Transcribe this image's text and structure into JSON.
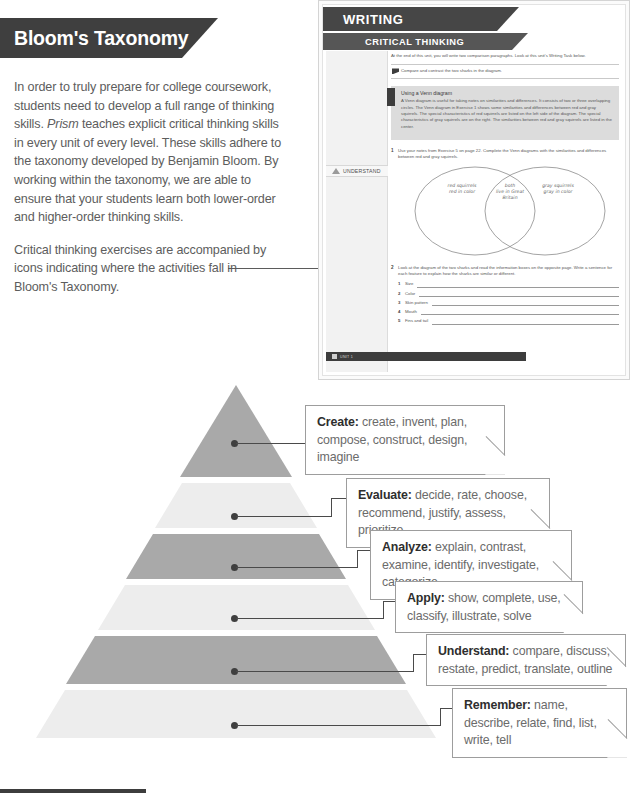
{
  "header": {
    "title": "Bloom's Taxonomy"
  },
  "intro": {
    "paragraph1_a": "In order to truly prepare for college coursework, students need to develop a full range of thinking skills. ",
    "paragraph1_em": "Prism",
    "paragraph1_b": " teaches explicit critical thinking skills in every unit of every level. These skills adhere to the taxonomy developed by Benjamin Bloom. By working within the taxonomy, we are able to ensure that your students learn both lower-order and higher-order thinking skills.",
    "paragraph2": "Critical thinking exercises are accompanied by icons indicating where the activities fall in Bloom's Taxonomy."
  },
  "page_mockup": {
    "banner_writing": "WRITING",
    "banner_critical_thinking": "CRITICAL THINKING",
    "intro_text": "At the end of this unit, you will write two comparison paragraphs. Look at this unit's Writing Task below.",
    "task_text": "Compare and contrast the two sharks in the diagram.",
    "skills_title": "Using a Venn diagram",
    "skills_body": "A Venn diagram is useful for taking notes on similarities and differences. It consists of two or three overlapping circles. The Venn diagram in Exercise 1 shows some similarities and differences between red and gray squirrels. The special characteristics of red squirrels are listed on the left side of the diagram. The special characteristics of gray squirrels are on the right. The similarities between red and gray squirrels are listed in the center.",
    "exercise1_num": "1",
    "exercise1_text": "Use your notes from Exercise 5 on page 22. Complete the Venn diagrams with the similarities and differences between red and gray squirrels.",
    "venn": {
      "left_line1": "red squirrels",
      "left_line2": "red in color",
      "center_line1": "both",
      "center_line2": "live in Great",
      "center_line3": "Britain",
      "right_line1": "gray squirrels",
      "right_line2": "gray in color"
    },
    "exercise2_num": "2",
    "exercise2_text": "Look at the diagram of the two sharks and read the information boxes on the opposite page. Write a sentence for each feature to explain how the sharks are similar or different.",
    "exercise2_items": [
      {
        "n": "1",
        "label": "Size"
      },
      {
        "n": "2",
        "label": "Color"
      },
      {
        "n": "3",
        "label": "Skin pattern"
      },
      {
        "n": "4",
        "label": "Mouth"
      },
      {
        "n": "5",
        "label": "Fins and tail"
      }
    ],
    "understand_chip": "UNDERSTAND",
    "footer_text": "UNIT 1"
  },
  "pyramid": {
    "levels": [
      {
        "id": "create",
        "label": "Create:",
        "verbs": " create, invent, plan, compose, construct, design, imagine",
        "color": "#a9a9a9"
      },
      {
        "id": "evaluate",
        "label": "Evaluate:",
        "verbs": " decide, rate, choose, recommend, justify, assess, prioritize",
        "color": "#ededed"
      },
      {
        "id": "analyze",
        "label": "Analyze:",
        "verbs": " explain, contrast, examine, identify, investigate, categorize",
        "color": "#a9a9a9"
      },
      {
        "id": "apply",
        "label": "Apply:",
        "verbs": " show, complete, use, classify, illustrate, solve",
        "color": "#ededed"
      },
      {
        "id": "understand",
        "label": "Understand:",
        "verbs": " compare, discuss, restate, predict, translate, outline",
        "color": "#a9a9a9"
      },
      {
        "id": "remember",
        "label": "Remember:",
        "verbs": " name, describe, relate, find, list, write, tell",
        "color": "#ededed"
      }
    ]
  },
  "colors": {
    "banner_dark": "#3f3f3f",
    "band_dark": "#a9a9a9",
    "band_light": "#ededed",
    "body_text": "#5d5d5d",
    "heading_text": "#2e2e2e"
  }
}
